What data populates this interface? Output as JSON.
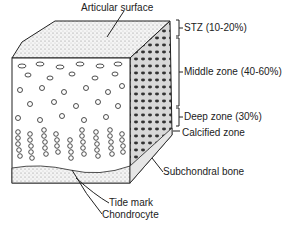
{
  "labels": {
    "articular_surface": "Articular surface",
    "stz": "STZ (10-20%)",
    "middle_zone": "Middle zone (40-60%)",
    "deep_zone": "Deep zone (30%)",
    "calcified_zone": "Calcified zone",
    "subchondral_bone": "Subchondral bone",
    "tide_mark": "Tide mark",
    "chondrocyte": "Chondrocyte"
  },
  "colors": {
    "ink": "#222222",
    "bone": "#e6e6e6",
    "surface": "#f2f2f2"
  }
}
